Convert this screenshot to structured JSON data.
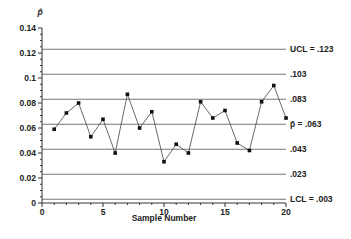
{
  "chart_data": {
    "type": "line",
    "title": "",
    "xlabel": "Sample Number",
    "ylabel": "p̂",
    "xlim": [
      0,
      20
    ],
    "ylim": [
      0,
      0.14
    ],
    "x_ticks": [
      0,
      5,
      10,
      15,
      20
    ],
    "y_ticks": [
      0,
      0.02,
      0.04,
      0.06,
      0.08,
      0.1,
      0.12,
      0.14
    ],
    "y_tick_labels": [
      "0",
      "0.02",
      "0.04",
      "0.06",
      "0.08",
      "0.1",
      "0.12",
      "0.14"
    ],
    "grid": false,
    "legend": null,
    "x": [
      1,
      2,
      3,
      4,
      5,
      6,
      7,
      8,
      9,
      10,
      11,
      12,
      13,
      14,
      15,
      16,
      17,
      18,
      19,
      20
    ],
    "series": [
      {
        "name": "Sample proportion",
        "values": [
          0.059,
          0.072,
          0.08,
          0.053,
          0.067,
          0.04,
          0.087,
          0.06,
          0.073,
          0.033,
          0.047,
          0.04,
          0.081,
          0.068,
          0.074,
          0.048,
          0.042,
          0.081,
          0.094,
          0.068
        ]
      }
    ],
    "reference_lines": [
      {
        "value": 0.123,
        "label": "UCL = .123"
      },
      {
        "value": 0.103,
        "label": ".103"
      },
      {
        "value": 0.083,
        "label": ".083"
      },
      {
        "value": 0.063,
        "label": "p̄ = .063"
      },
      {
        "value": 0.043,
        "label": ".043"
      },
      {
        "value": 0.023,
        "label": ".023"
      },
      {
        "value": 0.003,
        "label": "LCL = .003"
      }
    ]
  }
}
